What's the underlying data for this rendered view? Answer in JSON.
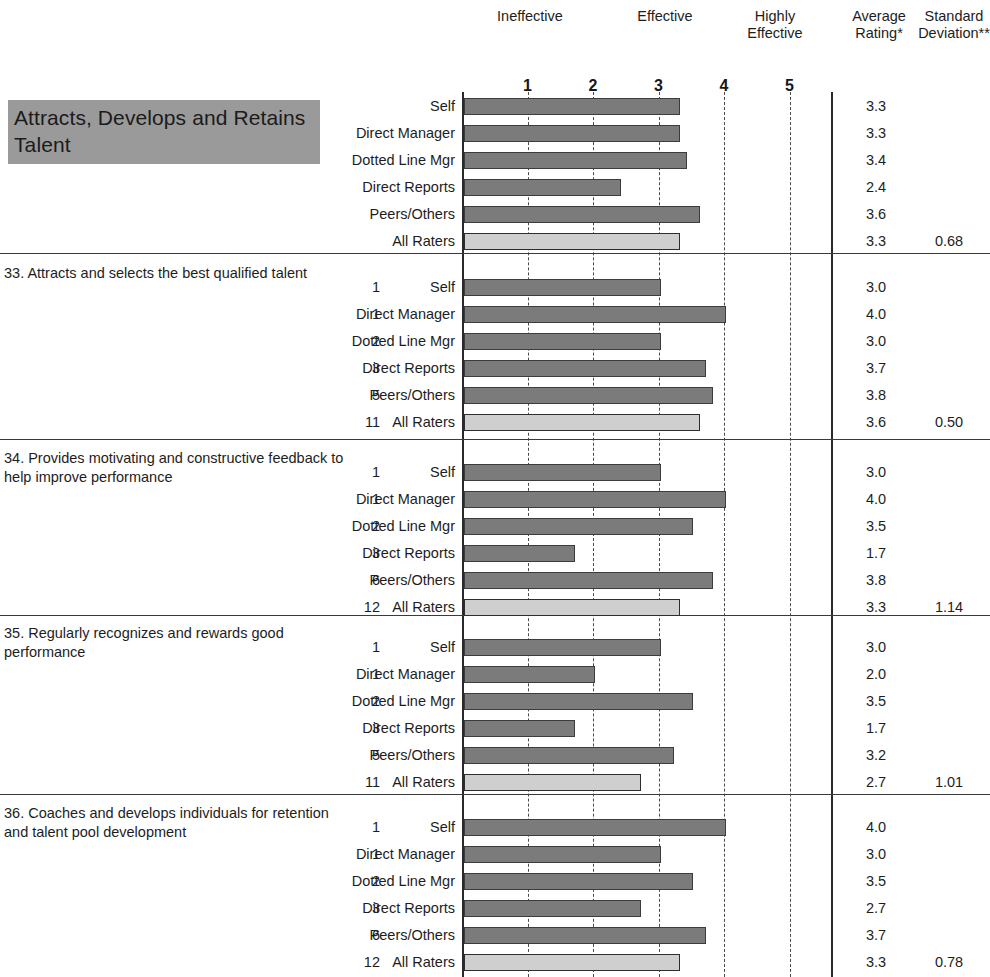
{
  "header": {
    "scale_labels": [
      "Ineffective",
      "Effective",
      "Highly Effective"
    ],
    "ineffective": "Ineffective",
    "effective": "Effective",
    "highly_effective": "Highly\nEffective",
    "highly_effective_l1": "Highly",
    "highly_effective_l2": "Effective",
    "average_rating_l1": "Average",
    "average_rating_l2": "Rating*",
    "standard_deviation_l1": "Standard",
    "standard_deviation_l2": "Deviation**"
  },
  "competency": {
    "title": "Attracts, Develops and Retains Talent",
    "plate_color": "#9a9a9a"
  },
  "axis": {
    "ticks": [
      "1",
      "2",
      "3",
      "4",
      "5"
    ],
    "min": 0,
    "max": 5
  },
  "rater_groups": [
    "Self",
    "Direct Manager",
    "Dotted Line Mgr",
    "Direct Reports",
    "Peers/Others",
    "All Raters"
  ],
  "chart_data": {
    "type": "bar",
    "title": "Attracts, Develops and Retains Talent",
    "xlabel": "",
    "ylabel": "",
    "xlim": [
      0,
      5
    ],
    "grid": true,
    "orientation": "horizontal",
    "axis_tick_labels": [
      "1",
      "2",
      "3",
      "4",
      "5"
    ],
    "scale_zones": [
      "Ineffective",
      "Effective",
      "Highly Effective"
    ],
    "categories": [
      "Self",
      "Direct Manager",
      "Dotted Line Mgr",
      "Direct Reports",
      "Peers/Others",
      "All Raters"
    ],
    "sections": [
      {
        "id": "summary",
        "label": "Attracts, Develops and Retains Talent",
        "is_summary": true,
        "rows": [
          {
            "count": "",
            "label": "Self",
            "value": 3.3,
            "avg": "3.3",
            "sd": "",
            "highlight": false
          },
          {
            "count": "",
            "label": "Direct Manager",
            "value": 3.3,
            "avg": "3.3",
            "sd": "",
            "highlight": false
          },
          {
            "count": "",
            "label": "Dotted Line Mgr",
            "value": 3.4,
            "avg": "3.4",
            "sd": "",
            "highlight": false
          },
          {
            "count": "",
            "label": "Direct Reports",
            "value": 2.4,
            "avg": "2.4",
            "sd": "",
            "highlight": false
          },
          {
            "count": "",
            "label": "Peers/Others",
            "value": 3.6,
            "avg": "3.6",
            "sd": "",
            "highlight": false
          },
          {
            "count": "",
            "label": "All Raters",
            "value": 3.3,
            "avg": "3.3",
            "sd": "0.68",
            "highlight": true
          }
        ]
      },
      {
        "id": "item-33",
        "label": "33. Attracts and selects the best qualified talent",
        "is_summary": false,
        "rows": [
          {
            "count": "1",
            "label": "Self",
            "value": 3.0,
            "avg": "3.0",
            "sd": "",
            "highlight": false
          },
          {
            "count": "1",
            "label": "Direct Manager",
            "value": 4.0,
            "avg": "4.0",
            "sd": "",
            "highlight": false
          },
          {
            "count": "2",
            "label": "Dotted Line Mgr",
            "value": 3.0,
            "avg": "3.0",
            "sd": "",
            "highlight": false
          },
          {
            "count": "3",
            "label": "Direct Reports",
            "value": 3.7,
            "avg": "3.7",
            "sd": "",
            "highlight": false
          },
          {
            "count": "5",
            "label": "Peers/Others",
            "value": 3.8,
            "avg": "3.8",
            "sd": "",
            "highlight": false
          },
          {
            "count": "11",
            "label": "All Raters",
            "value": 3.6,
            "avg": "3.6",
            "sd": "0.50",
            "highlight": true
          }
        ]
      },
      {
        "id": "item-34",
        "label": "34. Provides motivating and constructive feedback to help improve performance",
        "is_summary": false,
        "rows": [
          {
            "count": "1",
            "label": "Self",
            "value": 3.0,
            "avg": "3.0",
            "sd": "",
            "highlight": false
          },
          {
            "count": "1",
            "label": "Direct Manager",
            "value": 4.0,
            "avg": "4.0",
            "sd": "",
            "highlight": false
          },
          {
            "count": "2",
            "label": "Dotted Line Mgr",
            "value": 3.5,
            "avg": "3.5",
            "sd": "",
            "highlight": false
          },
          {
            "count": "3",
            "label": "Direct Reports",
            "value": 1.7,
            "avg": "1.7",
            "sd": "",
            "highlight": false
          },
          {
            "count": "6",
            "label": "Peers/Others",
            "value": 3.8,
            "avg": "3.8",
            "sd": "",
            "highlight": false
          },
          {
            "count": "12",
            "label": "All Raters",
            "value": 3.3,
            "avg": "3.3",
            "sd": "1.14",
            "highlight": true
          }
        ]
      },
      {
        "id": "item-35",
        "label": "35. Regularly recognizes and rewards good performance",
        "is_summary": false,
        "rows": [
          {
            "count": "1",
            "label": "Self",
            "value": 3.0,
            "avg": "3.0",
            "sd": "",
            "highlight": false
          },
          {
            "count": "1",
            "label": "Direct Manager",
            "value": 2.0,
            "avg": "2.0",
            "sd": "",
            "highlight": false
          },
          {
            "count": "2",
            "label": "Dotted Line Mgr",
            "value": 3.5,
            "avg": "3.5",
            "sd": "",
            "highlight": false
          },
          {
            "count": "3",
            "label": "Direct Reports",
            "value": 1.7,
            "avg": "1.7",
            "sd": "",
            "highlight": false
          },
          {
            "count": "5",
            "label": "Peers/Others",
            "value": 3.2,
            "avg": "3.2",
            "sd": "",
            "highlight": false
          },
          {
            "count": "11",
            "label": "All Raters",
            "value": 2.7,
            "avg": "2.7",
            "sd": "1.01",
            "highlight": true
          }
        ]
      },
      {
        "id": "item-36",
        "label": "36. Coaches and develops individuals for retention and talent pool development",
        "is_summary": false,
        "rows": [
          {
            "count": "1",
            "label": "Self",
            "value": 4.0,
            "avg": "4.0",
            "sd": "",
            "highlight": false
          },
          {
            "count": "1",
            "label": "Direct Manager",
            "value": 3.0,
            "avg": "3.0",
            "sd": "",
            "highlight": false
          },
          {
            "count": "2",
            "label": "Dotted Line Mgr",
            "value": 3.5,
            "avg": "3.5",
            "sd": "",
            "highlight": false
          },
          {
            "count": "3",
            "label": "Direct Reports",
            "value": 2.7,
            "avg": "2.7",
            "sd": "",
            "highlight": false
          },
          {
            "count": "6",
            "label": "Peers/Others",
            "value": 3.7,
            "avg": "3.7",
            "sd": "",
            "highlight": false
          },
          {
            "count": "12",
            "label": "All Raters",
            "value": 3.3,
            "avg": "3.3",
            "sd": "0.78",
            "highlight": true
          }
        ]
      }
    ]
  }
}
